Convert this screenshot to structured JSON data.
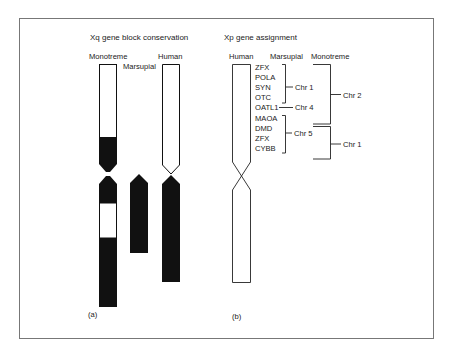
{
  "panel_a": {
    "title": "Xq gene block conservation",
    "labels": {
      "monotreme": "Monotreme",
      "marsupial": "Marsupial",
      "human": "Human"
    },
    "panel_label": "(a)"
  },
  "panel_b": {
    "title": "Xp gene assignment",
    "column_headers": {
      "human": "Human",
      "marsupial": "Marsupial",
      "monotreme": "Monotreme"
    },
    "genes": [
      "ZFX",
      "POLA",
      "SYN",
      "OTC",
      "OATL1",
      "MAOA",
      "DMD",
      "ZFX",
      "CYBB"
    ],
    "marsupial_groups": [
      {
        "label": "Chr 1",
        "genes": [
          "ZFX",
          "POLA",
          "SYN",
          "OTC"
        ]
      },
      {
        "label": "Chr 4",
        "genes": [
          "OATL1"
        ]
      },
      {
        "label": "Chr 5",
        "genes": [
          "MAOA",
          "DMD",
          "ZFX",
          "CYBB"
        ]
      }
    ],
    "monotreme_groups": [
      {
        "label": "Chr 2",
        "genes": [
          "ZFX",
          "POLA",
          "SYN",
          "OTC",
          "OATL1"
        ]
      },
      {
        "label": "Chr 1",
        "genes": [
          "MAOA",
          "DMD",
          "ZFX",
          "CYBB"
        ]
      }
    ],
    "panel_label": "(b)"
  },
  "colors": {
    "ink": "#111111",
    "frame": "#777777",
    "paper": "#ffffff"
  }
}
